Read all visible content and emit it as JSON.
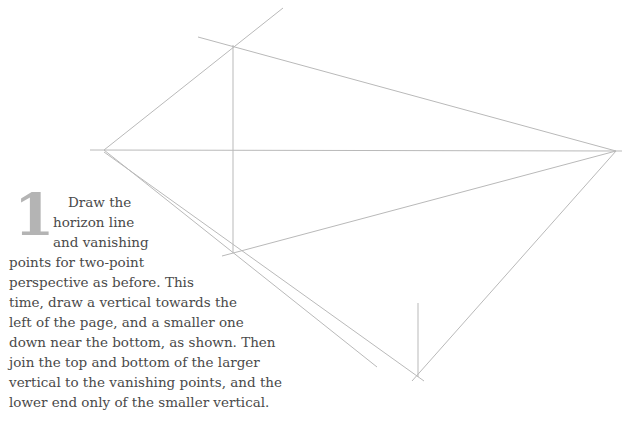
{
  "step": {
    "number": "1",
    "lines": [
      "Draw the",
      "horizon line",
      "and vanishing",
      "points for two-point",
      "perspective as before. This",
      "time, draw a vertical towards the",
      "left of the page, and a smaller one",
      "down near the bottom, as shown. Then",
      "join the top and bottom of the larger",
      "vertical to the vanishing points, and the",
      "lower end only of the smaller vertical."
    ]
  },
  "drawing": {
    "line_color": "#b9b9b9",
    "left_vanishing_point": [
      104,
      150
    ],
    "right_vanishing_point": [
      616,
      151
    ],
    "large_vertical": {
      "x": 233,
      "top": 45,
      "bottom": 253
    },
    "small_vertical": {
      "x": 418,
      "top": 303,
      "bottom": 377
    }
  }
}
